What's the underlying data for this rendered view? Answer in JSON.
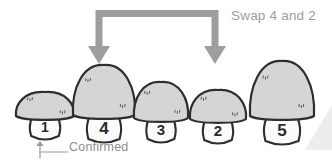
{
  "canvas": {
    "width": 332,
    "height": 163,
    "background": "#ffffff"
  },
  "palette": {
    "arrow_gray": "#9e9e9e",
    "label_gray": "#9b9b9b",
    "cap_fill": "#d4d5d6",
    "stem_fill": "#fbfbfb",
    "outline": "#2e2e2e",
    "number": "#2b2b2b"
  },
  "annotations": {
    "swap_label": "Swap 4 and 2",
    "confirmed_label": "Confirmed"
  },
  "swap_arrow": {
    "name": "swap-bracket-arrow",
    "from_index": 1,
    "to_index": 3,
    "left_arrow_x": 99,
    "right_arrow_x": 215,
    "top_y": 10,
    "tip_y": 64
  },
  "confirmed_pointer": {
    "name": "confirmed-pointer",
    "target_index": 0,
    "arrow_x": 40,
    "arrow_top_y": 141,
    "arrow_bottom_y": 158,
    "line_to_x": 68,
    "line_y": 152
  },
  "chart_data": {
    "type": "bar",
    "title": "Swap 4 and 2",
    "xlabel": "",
    "ylabel": "value",
    "categories": [
      "1",
      "4",
      "3",
      "2",
      "5"
    ],
    "values": [
      1,
      4,
      3,
      2,
      5
    ],
    "ylim": [
      0,
      5
    ],
    "grid": false,
    "legend": null,
    "annotations": [
      "Swap 4 and 2",
      "Confirmed"
    ]
  },
  "mushrooms": [
    {
      "name": "mushroom-1",
      "label": "1",
      "value": 1,
      "state": "confirmed",
      "highlighted": false,
      "cx": 45,
      "cap_width": 58,
      "cap_height": 26,
      "cap_base_y": 118,
      "stem_width": 30,
      "stem_height": 24,
      "font_size": 14
    },
    {
      "name": "mushroom-4",
      "label": "4",
      "value": 4,
      "state": "selected",
      "highlighted": true,
      "cx": 104,
      "cap_width": 62,
      "cap_height": 52,
      "cap_base_y": 117,
      "stem_width": 34,
      "stem_height": 28,
      "font_size": 17
    },
    {
      "name": "mushroom-3",
      "label": "3",
      "value": 3,
      "state": "idle",
      "highlighted": false,
      "cx": 161,
      "cap_width": 54,
      "cap_height": 38,
      "cap_base_y": 120,
      "stem_width": 29,
      "stem_height": 25,
      "font_size": 15
    },
    {
      "name": "mushroom-2",
      "label": "2",
      "value": 2,
      "state": "selected",
      "highlighted": true,
      "cx": 218,
      "cap_width": 56,
      "cap_height": 31,
      "cap_base_y": 121,
      "stem_width": 30,
      "stem_height": 25,
      "font_size": 15
    },
    {
      "name": "mushroom-5",
      "label": "5",
      "value": 5,
      "state": "idle",
      "highlighted": false,
      "cx": 282,
      "cap_width": 64,
      "cap_height": 57,
      "cap_base_y": 118,
      "stem_width": 36,
      "stem_height": 29,
      "font_size": 17
    }
  ]
}
